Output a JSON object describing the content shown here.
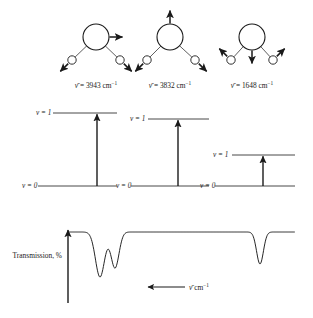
{
  "figure": {
    "stroke_color": "#1a1a1a",
    "background_color": "#ffffff"
  },
  "modes": [
    {
      "id": "asymmetric-stretch",
      "wavenumber_label": "ν̄ = 3943 cm⁻¹",
      "wavenumber": 3943,
      "units": "cm⁻¹",
      "oxygen_arrow_direction": "right",
      "hydrogen_left_arrow_direction": "down-left",
      "hydrogen_right_arrow_direction": "down-right",
      "oxygen_center": [
        96,
        37
      ],
      "oxygen_radius": 13,
      "hydrogen_left_center": [
        72,
        60
      ],
      "hydrogen_right_center": [
        120,
        60
      ],
      "hydrogen_radius": 4.2,
      "label_position": [
        96,
        88
      ]
    },
    {
      "id": "symmetric-stretch",
      "wavenumber_label": "ν̄ = 3832 cm⁻¹",
      "wavenumber": 3832,
      "units": "cm⁻¹",
      "oxygen_arrow_direction": "up",
      "hydrogen_left_arrow_direction": "down-left",
      "hydrogen_right_arrow_direction": "down-right",
      "oxygen_center": [
        170,
        37
      ],
      "oxygen_radius": 13,
      "hydrogen_left_center": [
        147,
        60
      ],
      "hydrogen_right_center": [
        195,
        60
      ],
      "hydrogen_radius": 4.2,
      "label_position": [
        170,
        88
      ]
    },
    {
      "id": "bend",
      "wavenumber_label": "ν̄ = 1648 cm⁻¹",
      "wavenumber": 1648,
      "units": "cm⁻¹",
      "oxygen_arrow_direction": "down",
      "hydrogen_left_arrow_direction": "up-left",
      "hydrogen_right_arrow_direction": "up-right",
      "oxygen_center": [
        252,
        37
      ],
      "oxygen_radius": 13,
      "hydrogen_left_center": [
        231,
        60
      ],
      "hydrogen_right_center": [
        273,
        60
      ],
      "hydrogen_radius": 4.2,
      "label_position": [
        252,
        88
      ]
    }
  ],
  "energy_diagrams": [
    {
      "id": "energy-diagram-1",
      "upper_level_label": "v = 1",
      "lower_level_label": "v = 0",
      "upper_level_y": 113,
      "lower_level_y": 186,
      "line_x_start": 53,
      "line_x_end": 117,
      "lower_line_x_start": 38,
      "lower_line_x_end": 117,
      "arrow_x": 97,
      "upper_label_x": 36,
      "lower_label_x": 22
    },
    {
      "id": "energy-diagram-2",
      "upper_level_label": "v = 1",
      "lower_level_label": "v = 0",
      "upper_level_y": 119,
      "lower_level_y": 186,
      "line_x_start": 148,
      "line_x_end": 209,
      "lower_line_x_start": 131,
      "lower_line_x_end": 209,
      "arrow_x": 178,
      "upper_label_x": 130,
      "lower_label_x": 116
    },
    {
      "id": "energy-diagram-3",
      "upper_level_label": "v = 1",
      "lower_level_label": "v = 0",
      "upper_level_y": 155,
      "lower_level_y": 186,
      "line_x_start": 232,
      "line_x_end": 295,
      "lower_line_x_start": 215,
      "lower_line_x_end": 295,
      "arrow_x": 263,
      "upper_label_x": 213,
      "lower_label_x": 200
    }
  ],
  "spectrum": {
    "y_axis_label": "Transmission, %",
    "x_axis_label": "ν̄ cm⁻¹",
    "x_axis_arrow_direction": "left",
    "baseline_y": 232,
    "axis_x": 68,
    "axis_top_y": 230,
    "axis_bottom_y": 303,
    "baseline_x_start": 68,
    "baseline_x_end": 295,
    "peaks": [
      {
        "id": "peak-3943",
        "center_x": 100,
        "depth": 45,
        "half_width": 8,
        "assignment": "3943"
      },
      {
        "id": "peak-3832",
        "center_x": 115,
        "depth": 36,
        "half_width": 7,
        "assignment": "3832"
      },
      {
        "id": "peak-1648",
        "center_x": 260,
        "depth": 32,
        "half_width": 6,
        "assignment": "1648"
      }
    ]
  }
}
